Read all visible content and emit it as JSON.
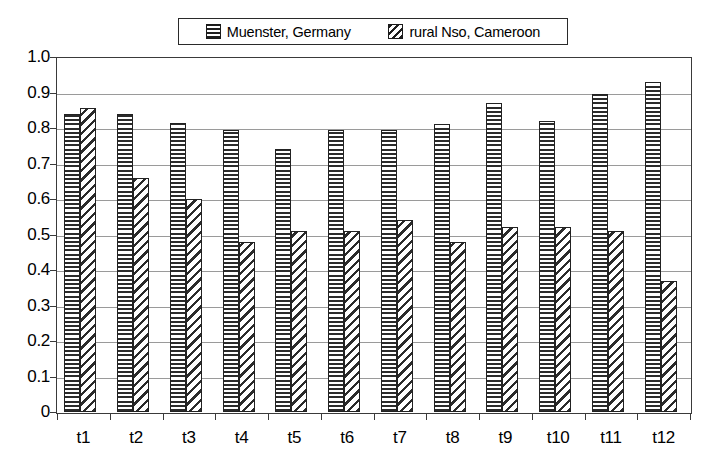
{
  "chart_data": {
    "type": "bar",
    "title": "",
    "subtitle": "",
    "xlabel": "",
    "ylabel": "",
    "categories": [
      "t1",
      "t2",
      "t3",
      "t4",
      "t5",
      "t6",
      "t7",
      "t8",
      "t9",
      "t10",
      "t11",
      "t12"
    ],
    "series": [
      {
        "name": "Muenster, Germany",
        "pattern": "horizontal-stripes",
        "values": [
          0.84,
          0.84,
          0.815,
          0.795,
          0.74,
          0.795,
          0.795,
          0.81,
          0.87,
          0.82,
          0.895,
          0.93
        ]
      },
      {
        "name": "rural Nso, Cameroon",
        "pattern": "diagonal-stripes",
        "values": [
          0.855,
          0.66,
          0.6,
          0.48,
          0.51,
          0.51,
          0.54,
          0.48,
          0.52,
          0.52,
          0.51,
          0.37
        ]
      }
    ],
    "ylim": [
      0,
      1.0
    ],
    "ytick_values": [
      0,
      0.1,
      0.2,
      0.3,
      0.4,
      0.5,
      0.6,
      0.7,
      0.8,
      0.9,
      1.0
    ],
    "ytick_labels": [
      "0",
      "0.1",
      "0.2",
      "0.3",
      "0.4",
      "0.5",
      "0.6",
      "0.7",
      "0.8",
      "0.9",
      "1.0"
    ],
    "grid": true,
    "grid_axis": "y",
    "legend_position": "top-center"
  },
  "legend": {
    "entries": [
      {
        "label": "Muenster, Germany",
        "swatch": "horizontal-stripe-swatch"
      },
      {
        "label": "rural Nso, Cameroon",
        "swatch": "diagonal-stripe-swatch"
      }
    ]
  },
  "colors": {
    "ink": "#222222",
    "grid": "#9a9a9a",
    "background": "#ffffff"
  }
}
